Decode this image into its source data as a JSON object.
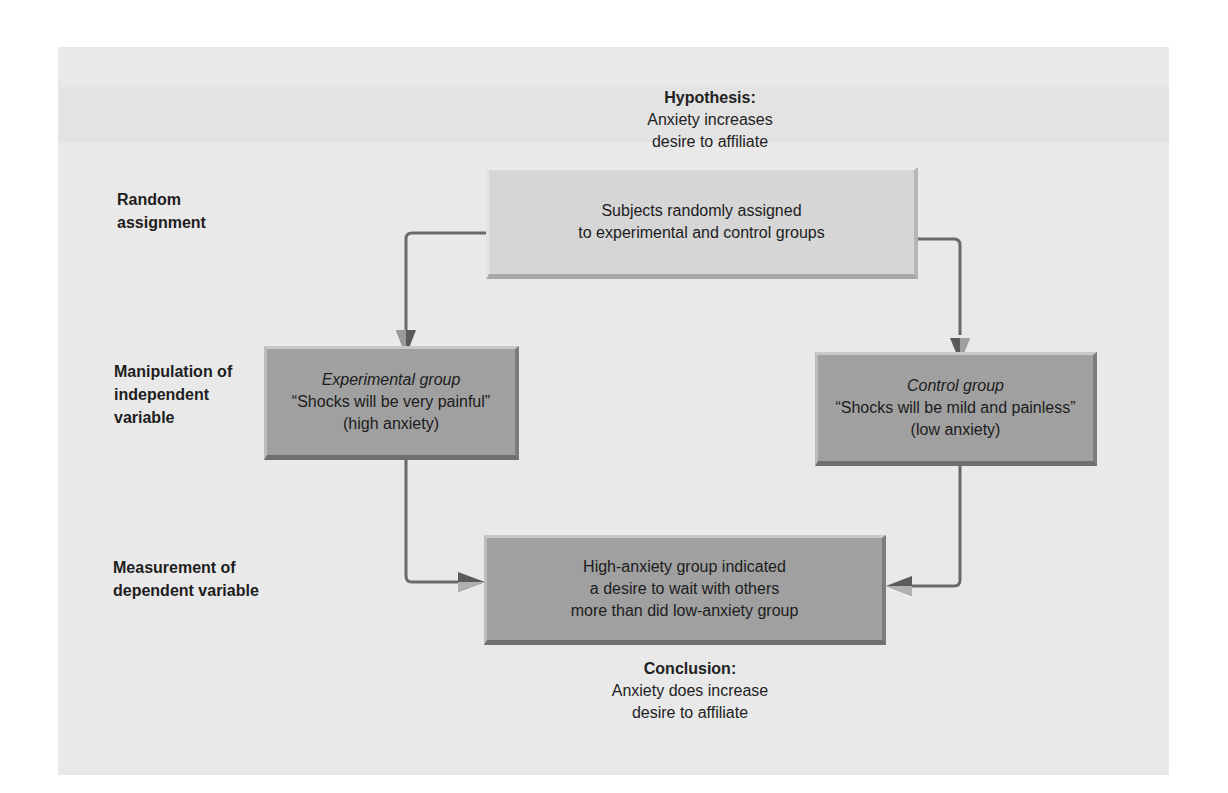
{
  "hypothesis": {
    "heading": "Hypothesis:",
    "line1": "Anxiety increases",
    "line2": "desire to affiliate"
  },
  "row_labels": {
    "random_assignment": [
      "Random",
      "assignment"
    ],
    "manipulation": [
      "Manipulation of",
      "independent",
      "variable"
    ],
    "measurement": [
      "Measurement of",
      "dependent variable"
    ]
  },
  "boxes": {
    "assignment": {
      "line1": "Subjects randomly assigned",
      "line2": "to experimental and control groups"
    },
    "experimental": {
      "title": "Experimental group",
      "quote": "“Shocks will be very painful”",
      "note": "(high anxiety)"
    },
    "control": {
      "title": "Control group",
      "quote": "“Shocks will be mild and painless”",
      "note": "(low anxiety)"
    },
    "result": {
      "line1": "High-anxiety group indicated",
      "line2": "a desire to wait with others",
      "line3": "more than did low-anxiety group"
    }
  },
  "conclusion": {
    "heading": "Conclusion:",
    "line1": "Anxiety does increase",
    "line2": "desire to affiliate"
  },
  "colors": {
    "panel_bg": "#e9e9e9",
    "light_box": "#d6d6d6",
    "dark_box": "#a0a0a0",
    "arrow": "#6a6a6a"
  }
}
